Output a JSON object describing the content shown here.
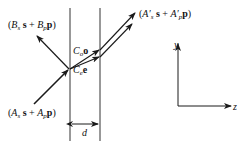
{
  "diagram": {
    "type": "optics-slab-wave-decomposition",
    "incident": {
      "coef_s": "A",
      "sub_s": "s",
      "vec_s": "s",
      "coef_p": "A",
      "sub_p": "p",
      "vec_p": "p",
      "plus": "+"
    },
    "reflected": {
      "coef_s": "B",
      "sub_s": "s",
      "vec_s": "s",
      "coef_p": "B",
      "sub_p": "p",
      "vec_p": "p",
      "plus": "+"
    },
    "transmitted": {
      "coef_s": "A′",
      "sub_s": "s",
      "vec_s": "s",
      "coef_p": "A′",
      "sub_p": "p",
      "vec_p": "p",
      "plus": "+"
    },
    "ordinary": {
      "coef": "C",
      "sub": "o",
      "vec": "o"
    },
    "extraordinary": {
      "coef": "C",
      "sub": "e",
      "vec": "e"
    },
    "thickness_label": "d",
    "axes": {
      "y_label": "y",
      "z_label": "z"
    },
    "colors": {
      "stroke": "#1a1a1a",
      "background": "#ffffff"
    }
  }
}
